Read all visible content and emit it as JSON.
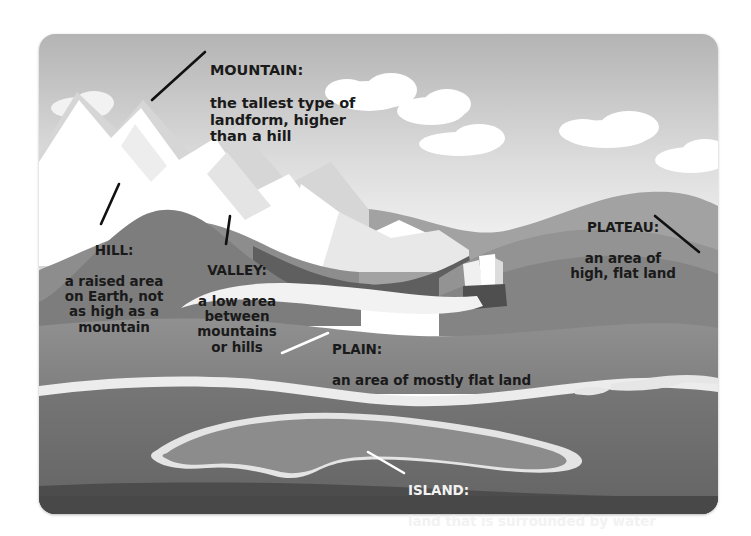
{
  "figure": {
    "panel": {
      "corner_radius_px": 16
    }
  },
  "palette": {
    "page_background": "#ffffff",
    "sky_top": "#b9b9b9",
    "sky_bottom": "#f4f4f4",
    "cloud": "#ffffff",
    "snow_peak": "#ffffff",
    "snow_shadow": "#d8d8d8",
    "far_hills": "#9a9a9a",
    "mid_hills": "#868686",
    "hill_dark": "#6f6f6f",
    "plateau_top": "#8f8f8f",
    "plain": "#8a8a8a",
    "river": "#f0f0f0",
    "water": "#6e6e6e",
    "island_land": "#8a8a8a",
    "island_shore": "#e8e8e8",
    "foreground_bank": "#4a4a4a",
    "label_dark": "#1a1a1a",
    "label_light": "#f2f2f2"
  },
  "labels": [
    {
      "id": "mountain",
      "term": "MOUNTAIN:",
      "description": "the tallest type of\nlandform, higher\nthan a hill",
      "text_color": "dark",
      "align": "left",
      "leader_color": "#111111"
    },
    {
      "id": "hill",
      "term": "HILL:",
      "description": "a raised area\non Earth, not\nas high as a\nmountain",
      "text_color": "dark",
      "align": "center",
      "leader_color": "#111111"
    },
    {
      "id": "valley",
      "term": "VALLEY:",
      "description": "a low area\nbetween\nmountains\nor hills",
      "text_color": "dark",
      "align": "center",
      "leader_color": "#111111"
    },
    {
      "id": "plateau",
      "term": "PLATEAU:",
      "description": "an area of\nhigh, flat land",
      "text_color": "dark",
      "align": "center",
      "leader_color": "#111111"
    },
    {
      "id": "plain",
      "term": "PLAIN:",
      "description": "an area of mostly flat land",
      "text_color": "dark",
      "align": "left",
      "leader_color": "#ffffff"
    },
    {
      "id": "island",
      "term": "ISLAND:",
      "description": "land that is surrounded by water",
      "text_color": "light",
      "align": "left",
      "leader_color": "#ffffff"
    }
  ],
  "scene_elements": [
    {
      "name": "sky",
      "kind": "gradient-band"
    },
    {
      "name": "clouds",
      "kind": "shape-group",
      "count": 6
    },
    {
      "name": "snow-capped-mountain",
      "kind": "shape-group"
    },
    {
      "name": "background-hills",
      "kind": "shape-group"
    },
    {
      "name": "hill",
      "kind": "shape"
    },
    {
      "name": "valley",
      "kind": "shape"
    },
    {
      "name": "plateau",
      "kind": "shape"
    },
    {
      "name": "waterfall",
      "kind": "shape"
    },
    {
      "name": "river",
      "kind": "shape"
    },
    {
      "name": "plain",
      "kind": "shape"
    },
    {
      "name": "water",
      "kind": "shape"
    },
    {
      "name": "island",
      "kind": "shape"
    },
    {
      "name": "sandbars",
      "kind": "shape-group",
      "count": 3
    },
    {
      "name": "foreground-bank",
      "kind": "shape"
    }
  ]
}
